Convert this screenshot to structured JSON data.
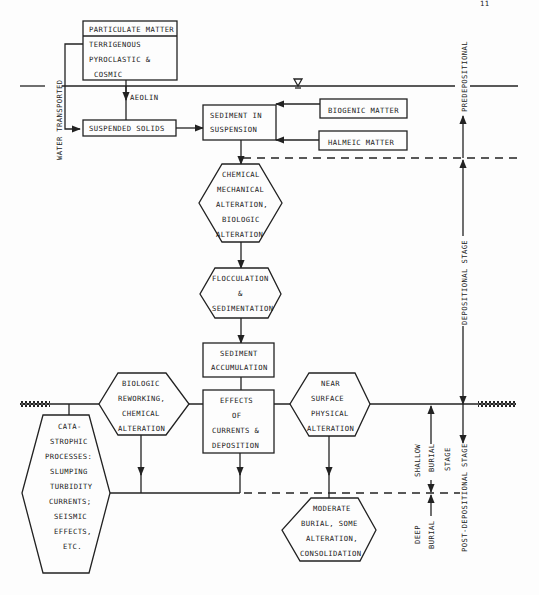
{
  "diagram": {
    "type": "flowchart",
    "nodes": {
      "particulate_matter": {
        "title": "PARTICULATE MATTER",
        "lines": [
          "TERRIGENOUS",
          "PYROCLASTIC &",
          "COSMIC"
        ]
      },
      "suspended_solids": {
        "label": "SUSPENDED SOLIDS"
      },
      "sediment_in_suspension": {
        "lines": [
          "SEDIMENT IN",
          "SUSPENSION"
        ]
      },
      "biogenic_matter": {
        "label": "BIOGENIC MATTER"
      },
      "halmeic_matter": {
        "label": "HALMEIC MATTER"
      },
      "chemical_alteration": {
        "lines": [
          "CHEMICAL",
          "MECHANICAL",
          "ALTERATION,",
          "BIOLOGIC",
          "ALTERATION"
        ]
      },
      "flocculation": {
        "lines": [
          "FLOCCULATION",
          "&",
          "SEDIMENTATION"
        ]
      },
      "sediment_accumulation": {
        "lines": [
          "SEDIMENT",
          "ACCUMULATION"
        ]
      },
      "biologic_reworking": {
        "lines": [
          "BIOLOGIC",
          "REWORKING,",
          "CHEMICAL",
          "ALTERATION"
        ]
      },
      "effects_of_currents": {
        "lines": [
          "EFFECTS",
          "OF",
          "CURRENTS &",
          "DEPOSITION"
        ]
      },
      "near_surface": {
        "lines": [
          "NEAR",
          "SURFACE",
          "PHYSICAL",
          "ALTERATION"
        ]
      },
      "catastrophic": {
        "lines": [
          "CATA-",
          "STROPHIC",
          "PROCESSES:",
          "SLUMPING",
          "TURBIDITY",
          "CURRENTS;",
          "SEISMIC",
          "EFFECTS,",
          "ETC."
        ]
      },
      "moderate_burial": {
        "lines": [
          "MODERATE",
          "BURIAL, SOME",
          "ALTERATION,",
          "CONSOLIDATION"
        ]
      }
    },
    "edge_labels": {
      "aeolin": "AEOLIN",
      "water_transported": "WATER TRANSPORTED"
    },
    "stage_labels": {
      "predepositional": "PREDEPOSITIONAL",
      "depositional": "DEPOSITIONAL STAGE",
      "post_depositional": "POST-DEPOSITIONAL STAGE",
      "shallow": "SHALLOW",
      "shallow_burial": "BURIAL",
      "shallow_stage": "STAGE",
      "deep": "DEEP",
      "deep_burial": "BURIAL"
    },
    "page_number": "11"
  }
}
